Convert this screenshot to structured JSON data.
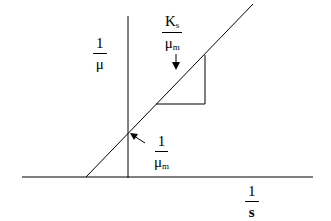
{
  "diagram": {
    "y_axis_label": {
      "numerator": "1",
      "denominator": "μ"
    },
    "x_axis_label": {
      "numerator": "1",
      "denominator": "s"
    },
    "slope_label": {
      "numerator": "K",
      "numerator_sub": "s",
      "denominator": "μ",
      "denominator_sub": "m"
    },
    "intercept_label": {
      "numerator": "1",
      "denominator": "μ",
      "denominator_sub": "m"
    },
    "colors": {
      "line": "#000000",
      "background": "#ffffff"
    }
  }
}
